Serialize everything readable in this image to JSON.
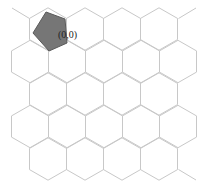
{
  "diagram": {
    "type": "hex-grid",
    "orientation": "pointy-top",
    "colors": {
      "grid_line": "#c8c8c8",
      "piece_fill": "#767676",
      "piece_stroke": "#5a5a5a",
      "label": "#222222",
      "background": "#ffffff"
    },
    "geometry": {
      "hex_half_width": 18.5,
      "hex_side": 21.2,
      "rows": [
        {
          "y": 29,
          "xs": [
            48,
            85,
            122,
            159
          ]
        },
        {
          "y": 61.5,
          "xs": [
            30,
            67,
            104,
            141,
            178
          ]
        },
        {
          "y": 94,
          "xs": [
            48,
            85,
            122,
            159
          ]
        },
        {
          "y": 126.5,
          "xs": [
            30,
            67,
            104,
            141,
            178
          ]
        },
        {
          "y": 159,
          "xs": [
            48,
            85,
            122,
            159
          ]
        }
      ],
      "extra_segments": [
        [
          [
            12,
            8
          ],
          [
            29.5,
            18.5
          ]
        ],
        [
          [
            178.5,
            18.5
          ],
          [
            196,
            8
          ]
        ],
        [
          [
            178.5,
            169.5
          ],
          [
            196,
            180
          ]
        ]
      ]
    },
    "piece": {
      "shape": "pentagon",
      "points": [
        [
          46,
          12
        ],
        [
          65,
          19
        ],
        [
          67,
          43
        ],
        [
          49,
          51
        ],
        [
          33,
          33
        ]
      ]
    },
    "label": {
      "text": "(0,0)",
      "x": 58,
      "y": 30
    }
  }
}
